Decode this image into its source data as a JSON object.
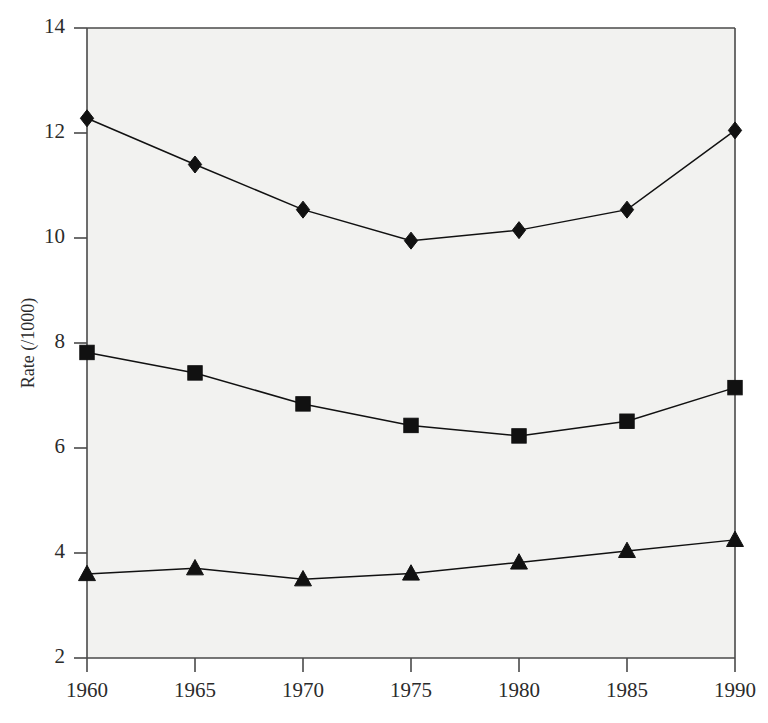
{
  "chart_data": {
    "type": "line",
    "title": "",
    "subtitle": "",
    "xlabel": "",
    "ylabel": "Rate (/1000)",
    "x": [
      1960,
      1965,
      1970,
      1975,
      1980,
      1985,
      1990
    ],
    "categories": [
      "1960",
      "1965",
      "1970",
      "1975",
      "1980",
      "1985",
      "1990"
    ],
    "xlim": [
      1960,
      1990
    ],
    "ylim": [
      2,
      14
    ],
    "xticks": [
      1960,
      1965,
      1970,
      1975,
      1980,
      1985,
      1990
    ],
    "xtick_labels": [
      "1960",
      "1965",
      "1970",
      "1975",
      "1980",
      "1985",
      "1990"
    ],
    "yticks": [
      2,
      4,
      6,
      8,
      10,
      12,
      14
    ],
    "ytick_labels": [
      "2",
      "4",
      "6",
      "8",
      "10",
      "12",
      "14"
    ],
    "grid": false,
    "legend": false,
    "legend_position": "none",
    "series": [
      {
        "name": "diamond-series",
        "marker": "diamond",
        "color": "#111111",
        "values": [
          12.28,
          11.4,
          10.54,
          9.95,
          10.15,
          10.54,
          12.05
        ]
      },
      {
        "name": "square-series",
        "marker": "square",
        "color": "#111111",
        "values": [
          7.82,
          7.43,
          6.84,
          6.43,
          6.23,
          6.51,
          7.15
        ]
      },
      {
        "name": "triangle-series",
        "marker": "triangle",
        "color": "#111111",
        "values": [
          3.6,
          3.71,
          3.5,
          3.61,
          3.82,
          4.04,
          4.25
        ]
      }
    ]
  },
  "style": {
    "plot_background": "#f2f2f0",
    "page_background": "#ffffff",
    "axis_color": "#4a4a4a",
    "ink_color": "#111111"
  },
  "axis": {
    "y_title": "Rate (/1000)"
  }
}
